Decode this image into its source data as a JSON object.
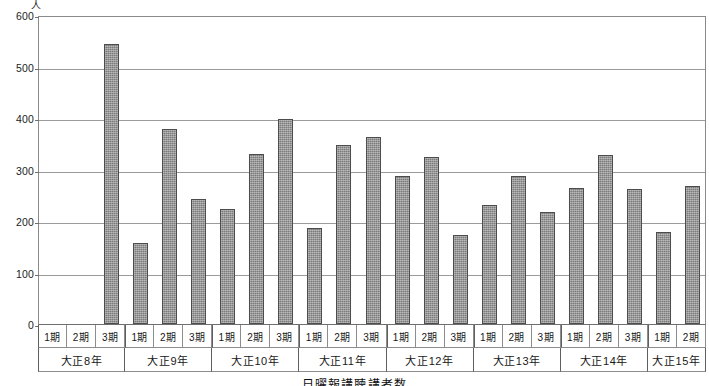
{
  "chart_data": {
    "type": "bar",
    "title": "日曜報講聴講者数",
    "unit_label": "人",
    "xlabel": "",
    "ylabel": "",
    "ylim": [
      0,
      600
    ],
    "ytick_step": 100,
    "yticks": [
      600,
      500,
      400,
      300,
      200,
      100,
      0
    ],
    "ytick_labels": [
      "600",
      "500",
      "400",
      "300",
      "200",
      "100",
      "0"
    ],
    "grid": true,
    "legend": "none",
    "bar_color": "#7b7b7b",
    "bar_edge_color": "#4c4c4c",
    "axis_color": "#6f6f6f",
    "grid_color": "#9b9b9b",
    "period_labels": [
      "1期",
      "2期",
      "3期"
    ],
    "groups": [
      {
        "year": "大正8年",
        "periods": [
          "1期",
          "2期",
          "3期"
        ],
        "values": [
          null,
          null,
          543
        ]
      },
      {
        "year": "大正9年",
        "periods": [
          "1期",
          "2期",
          "3期"
        ],
        "values": [
          157,
          378,
          242
        ]
      },
      {
        "year": "大正10年",
        "periods": [
          "1期",
          "2期",
          "3期"
        ],
        "values": [
          223,
          330,
          399
        ]
      },
      {
        "year": "大正11年",
        "periods": [
          "1期",
          "2期",
          "3期"
        ],
        "values": [
          187,
          347,
          363
        ]
      },
      {
        "year": "大正12年",
        "periods": [
          "1期",
          "2期",
          "3期"
        ],
        "values": [
          288,
          324,
          173
        ]
      },
      {
        "year": "大正13年",
        "periods": [
          "1期",
          "2期",
          "3期"
        ],
        "values": [
          231,
          288,
          217
        ]
      },
      {
        "year": "大正14年",
        "periods": [
          "1期",
          "2期",
          "3期"
        ],
        "values": [
          264,
          328,
          262
        ]
      },
      {
        "year": "大正15年",
        "periods": [
          "1期",
          "2期"
        ],
        "values": [
          178,
          268
        ]
      }
    ],
    "categories": [
      "大正8年 1期",
      "大正8年 2期",
      "大正8年 3期",
      "大正9年 1期",
      "大正9年 2期",
      "大正9年 3期",
      "大正10年 1期",
      "大正10年 2期",
      "大正10年 3期",
      "大正11年 1期",
      "大正11年 2期",
      "大正11年 3期",
      "大正12年 1期",
      "大正12年 2期",
      "大正12年 3期",
      "大正13年 1期",
      "大正13年 2期",
      "大正13年 3期",
      "大正14年 1期",
      "大正14年 2期",
      "大正14年 3期",
      "大正15年 1期",
      "大正15年 2期"
    ],
    "values": [
      null,
      null,
      543,
      157,
      378,
      242,
      223,
      330,
      399,
      187,
      347,
      363,
      288,
      324,
      173,
      231,
      288,
      217,
      264,
      328,
      262,
      178,
      268
    ]
  }
}
